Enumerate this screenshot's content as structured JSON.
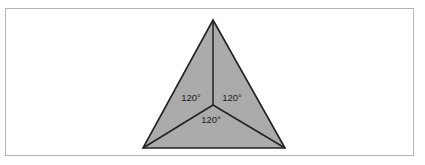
{
  "figure": {
    "title": "",
    "background_color": "#ffffff",
    "frame": {
      "border_color": "#b4b4b4",
      "fill_color": "#ffffff",
      "x": 5,
      "y": 8,
      "width": 409,
      "height": 148
    },
    "shape": {
      "name": "equilateral-triangle",
      "fill_color": "#ababab",
      "stroke_color": "#222222",
      "stroke_width": 1.6,
      "vertices": [
        {
          "name": "apex",
          "x": 213,
          "y": 20
        },
        {
          "name": "bottom-right",
          "x": 285,
          "y": 148
        },
        {
          "name": "bottom-left",
          "x": 143,
          "y": 148
        }
      ],
      "center": {
        "name": "centroid",
        "x": 213,
        "y": 105
      },
      "radii": [
        {
          "name": "radius-to-apex",
          "x1": 213,
          "y1": 105,
          "x2": 213,
          "y2": 20
        },
        {
          "name": "radius-to-bottom-left",
          "x1": 213,
          "y1": 105,
          "x2": 143,
          "y2": 148
        },
        {
          "name": "radius-to-bottom-right",
          "x1": 213,
          "y1": 105,
          "x2": 285,
          "y2": 148
        }
      ]
    },
    "labels": [
      {
        "name": "angle-label-left",
        "text": "120°",
        "x": 191,
        "y": 98
      },
      {
        "name": "angle-label-right",
        "text": "120°",
        "x": 232,
        "y": 98
      },
      {
        "name": "angle-label-bottom",
        "text": "120°",
        "x": 211,
        "y": 120
      }
    ]
  }
}
